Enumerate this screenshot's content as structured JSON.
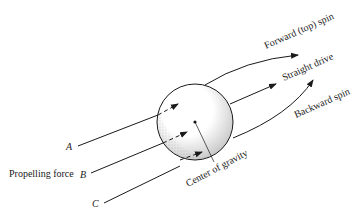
{
  "diagram": {
    "labels": {
      "forward_spin": "Forward (top) spin",
      "straight_drive": "Straight drive",
      "backward_spin": "Backward spin",
      "center_of_gravity": "Center of gravity",
      "propelling_force": "Propelling force",
      "force_a": "A",
      "force_b": "B",
      "force_c": "C"
    },
    "colors": {
      "ink": "#1a1a1a",
      "background": "#ffffff"
    }
  }
}
